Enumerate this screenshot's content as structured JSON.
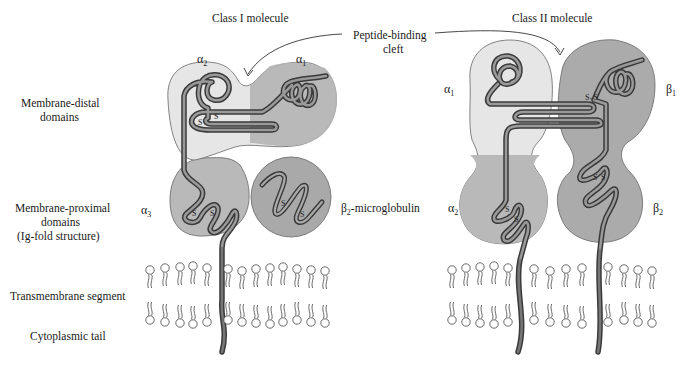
{
  "figure": {
    "titles": {
      "class1": "Class I molecule",
      "class2": "Class II molecule"
    },
    "annotation": {
      "cleft_line1": "Peptide-binding",
      "cleft_line2": "cleft"
    },
    "row_labels": {
      "distal_line1": "Membrane-distal",
      "distal_line2": "domains",
      "proximal_line1": "Membrane-proximal",
      "proximal_line2": "domains",
      "proximal_line3": "(Ig-fold structure)",
      "transmembrane": "Transmembrane segment",
      "cytoplasmic": "Cytoplasmic tail"
    },
    "domains": {
      "class1": {
        "alpha1": {
          "sym": "α",
          "sub": "1"
        },
        "alpha2": {
          "sym": "α",
          "sub": "2"
        },
        "alpha3": {
          "sym": "α",
          "sub": "3"
        },
        "b2m": {
          "sym": "β",
          "sub": "2",
          "suffix": "-microglobulin"
        }
      },
      "class2": {
        "alpha1": {
          "sym": "α",
          "sub": "1"
        },
        "alpha2": {
          "sym": "α",
          "sub": "2"
        },
        "beta1": {
          "sym": "β",
          "sub": "1"
        },
        "beta2": {
          "sym": "β",
          "sub": "2"
        }
      }
    },
    "disulfide_label": "S",
    "colors": {
      "light_domain": "#e6e6e6",
      "mid_domain": "#b9b9b9",
      "dark_domain": "#a9a9a9",
      "chain": "#6e6e6e",
      "outline": "#555555"
    }
  }
}
